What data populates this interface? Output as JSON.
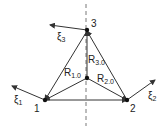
{
  "diagram": {
    "nodes": [
      {
        "id": "1",
        "label": "1"
      },
      {
        "id": "2",
        "label": "2"
      },
      {
        "id": "3",
        "label": "3"
      }
    ],
    "vectors": {
      "xi1": {
        "base": "ξ",
        "sub": "1"
      },
      "xi2": {
        "base": "ξ",
        "sub": "2"
      },
      "xi3": {
        "base": "ξ",
        "sub": "3"
      }
    },
    "radii": {
      "r1": {
        "base": "R",
        "sub": "1.0"
      },
      "r2": {
        "base": "R",
        "sub": "2.0"
      },
      "r3": {
        "base": "R",
        "sub": "3.0"
      }
    },
    "colors": {
      "line": "#333333"
    }
  }
}
